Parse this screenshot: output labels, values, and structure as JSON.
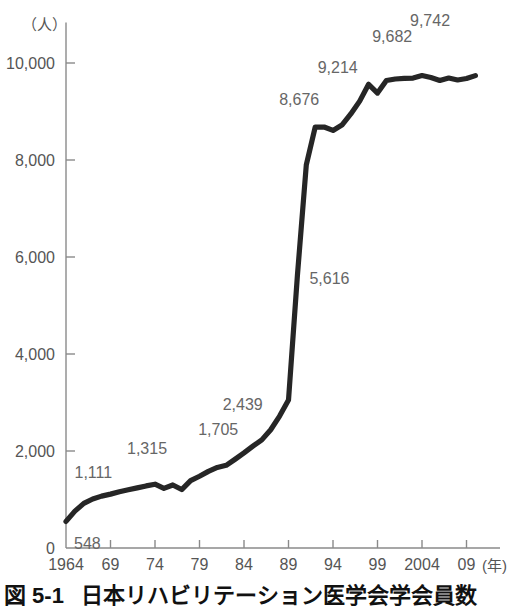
{
  "figure": {
    "number": "図 5-1",
    "caption": "日本リハビリテーション医学会学会員数",
    "y_axis_unit": "（人）",
    "x_axis_unit": "(年)"
  },
  "chart_data": {
    "type": "line",
    "title": "日本リハビリテーション医学会学会員数",
    "xlabel": "(年)",
    "ylabel": "（人）",
    "xlim": [
      1964,
      2011
    ],
    "ylim": [
      0,
      11000
    ],
    "grid": false,
    "legend": "none",
    "line_color": "#262626",
    "x_ticks": [
      "1964",
      "69",
      "74",
      "79",
      "84",
      "89",
      "94",
      "99",
      "2004",
      "09"
    ],
    "x_tick_values": [
      1964,
      1969,
      1974,
      1979,
      1984,
      1989,
      1994,
      1999,
      2004,
      2009
    ],
    "y_ticks": [
      "0",
      "2,000",
      "4,000",
      "6,000",
      "8,000",
      "10,000"
    ],
    "y_tick_values": [
      0,
      2000,
      4000,
      6000,
      8000,
      10000
    ],
    "x": [
      1964,
      1965,
      1966,
      1967,
      1968,
      1969,
      1970,
      1971,
      1972,
      1973,
      1974,
      1975,
      1976,
      1977,
      1978,
      1979,
      1980,
      1981,
      1982,
      1983,
      1984,
      1985,
      1986,
      1987,
      1988,
      1989,
      1990,
      1991,
      1992,
      1993,
      1994,
      1995,
      1996,
      1997,
      1998,
      1999,
      2000,
      2001,
      2002,
      2003,
      2004,
      2005,
      2006,
      2007,
      2008,
      2009,
      2010
    ],
    "values": [
      548,
      760,
      920,
      1010,
      1070,
      1111,
      1160,
      1200,
      1240,
      1280,
      1315,
      1230,
      1300,
      1205,
      1390,
      1480,
      1580,
      1660,
      1705,
      1830,
      1960,
      2100,
      2230,
      2439,
      2720,
      3050,
      5616,
      7900,
      8676,
      8680,
      8610,
      8720,
      8950,
      9214,
      9560,
      9380,
      9640,
      9670,
      9682,
      9690,
      9742,
      9700,
      9640,
      9690,
      9650,
      9680,
      9740
    ],
    "annotations": [
      {
        "label": "548",
        "value": 548,
        "year": 1964,
        "dx": 8,
        "dy": 28
      },
      {
        "label": "1,111",
        "value": 1111,
        "year": 1969,
        "dx": -36,
        "dy": -16
      },
      {
        "label": "1,315",
        "value": 1315,
        "year": 1974,
        "dx": -28,
        "dy": -30
      },
      {
        "label": "1,705",
        "value": 1705,
        "year": 1982,
        "dx": -28,
        "dy": -30
      },
      {
        "label": "2,439",
        "value": 2439,
        "year": 1987,
        "dx": -48,
        "dy": -20
      },
      {
        "label": "5,616",
        "value": 5616,
        "year": 1990,
        "dx": 12,
        "dy": 8
      },
      {
        "label": "8,676",
        "value": 8676,
        "year": 1992,
        "dx": -36,
        "dy": -22
      },
      {
        "label": "9,214",
        "value": 9214,
        "year": 1997,
        "dx": -42,
        "dy": -28
      },
      {
        "label": "9,682",
        "value": 9682,
        "year": 2002,
        "dx": -32,
        "dy": -36
      },
      {
        "label": "9,742",
        "value": 9742,
        "year": 2004,
        "dx": -12,
        "dy": -50
      }
    ]
  },
  "geometry": {
    "plot_left": 66,
    "plot_right": 500,
    "plot_baseline_y": 548,
    "plot_top_y": 36,
    "px_per_5yr": 44.5,
    "px_per_2000": 97
  }
}
